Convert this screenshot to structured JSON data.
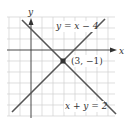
{
  "diagram": {
    "type": "coordinate-graph",
    "axes": {
      "x_label": "x",
      "y_label": "y"
    },
    "lines": [
      {
        "equation": "y = x − 4",
        "label": "y = x − 4",
        "color": "#555555"
      },
      {
        "equation": "x + y = 2",
        "label": "x + y = 2",
        "color": "#555555"
      }
    ],
    "intersection": {
      "label": "(3, −1)",
      "x": 3,
      "y": -1
    },
    "colors": {
      "grid": "#cccccc",
      "axis": "#333333",
      "line": "#555555",
      "point": "#333333"
    }
  }
}
